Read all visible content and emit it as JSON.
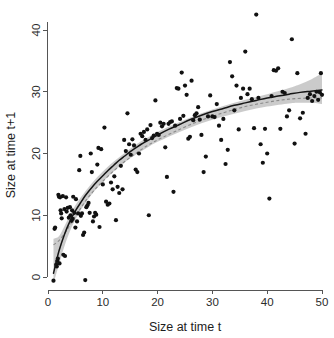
{
  "chart_data": {
    "type": "scatter",
    "title": "",
    "subtitle": "",
    "xlabel": "Size at time t",
    "ylabel": "Size at time t+1",
    "xlim": [
      -1,
      51
    ],
    "ylim": [
      -2.5,
      43.5
    ],
    "xticks": [
      0,
      10,
      20,
      30,
      40,
      50
    ],
    "yticks": [
      0,
      10,
      20,
      30,
      40
    ],
    "xtick_labels": [
      "0",
      "10",
      "20",
      "30",
      "40",
      "50"
    ],
    "ytick_labels": [
      "0",
      "10",
      "20",
      "30",
      "40"
    ],
    "grid": false,
    "legend": null,
    "legend_position": "none",
    "axis_style": "open-L",
    "background_color": "#ffffff",
    "point_color": "#111111",
    "point_radius": 2.1,
    "fit_line_color": "#151515",
    "ci_band_color": "#bdbdbd",
    "dashed_line_color": "#8a8a8a",
    "annotations": [],
    "series": [
      {
        "name": "observations",
        "type": "scatter",
        "x": [
          1.0,
          1.2,
          1.3,
          1.5,
          1.6,
          1.7,
          1.8,
          1.9,
          2.0,
          2.1,
          2.2,
          2.3,
          2.4,
          2.5,
          2.7,
          2.8,
          3.0,
          3.1,
          3.3,
          3.4,
          3.6,
          3.8,
          4.0,
          4.1,
          4.3,
          4.4,
          4.5,
          4.6,
          4.8,
          5.0,
          5.1,
          5.3,
          5.5,
          5.7,
          5.9,
          6.0,
          6.2,
          6.4,
          6.6,
          6.8,
          7.0,
          7.2,
          7.4,
          7.6,
          7.8,
          8.0,
          8.2,
          8.4,
          8.6,
          8.8,
          9.0,
          9.2,
          9.4,
          9.7,
          10.0,
          10.3,
          10.6,
          10.9,
          11.2,
          11.5,
          11.8,
          12.1,
          12.4,
          12.7,
          13.0,
          13.3,
          13.6,
          13.9,
          14.2,
          14.5,
          14.8,
          15.1,
          15.4,
          15.7,
          16.0,
          16.3,
          16.6,
          16.9,
          17.2,
          17.5,
          17.8,
          18.1,
          18.4,
          18.7,
          19.0,
          19.3,
          19.6,
          19.9,
          20.2,
          20.5,
          20.8,
          21.1,
          21.4,
          21.7,
          22.0,
          22.3,
          22.6,
          22.9,
          23.2,
          23.5,
          23.8,
          24.1,
          24.4,
          24.7,
          25.0,
          25.3,
          25.6,
          25.9,
          26.2,
          26.5,
          26.8,
          27.1,
          27.4,
          27.7,
          28.0,
          28.4,
          28.8,
          29.2,
          29.6,
          30.0,
          30.4,
          30.8,
          31.2,
          31.6,
          32.0,
          32.4,
          32.8,
          33.2,
          33.6,
          34.0,
          34.4,
          34.8,
          35.2,
          35.6,
          36.0,
          36.4,
          36.8,
          37.2,
          37.6,
          38.0,
          38.4,
          38.8,
          39.2,
          39.6,
          40.0,
          40.4,
          40.8,
          41.2,
          41.6,
          42.0,
          42.4,
          42.8,
          43.2,
          43.6,
          44.0,
          44.5,
          45.0,
          45.5,
          46.0,
          46.5,
          47.0,
          47.4,
          47.8,
          48.2,
          48.6,
          49.0,
          49.3,
          49.6,
          49.8,
          50.0
        ],
        "y": [
          -0.6,
          7.8,
          8.0,
          2.0,
          1.7,
          2.6,
          3.0,
          13.3,
          13.0,
          2.2,
          12.9,
          10.8,
          10.3,
          9.5,
          13.1,
          3.6,
          11.0,
          3.4,
          12.9,
          10.6,
          11.2,
          9.6,
          11.3,
          10.0,
          9.1,
          10.8,
          9.4,
          13.0,
          10.4,
          8.0,
          12.6,
          9.0,
          10.3,
          17.3,
          19.6,
          9.9,
          10.3,
          6.8,
          7.2,
          -0.5,
          11.3,
          11.6,
          12.0,
          10.4,
          20.0,
          17.0,
          9.0,
          9.8,
          10.4,
          10.1,
          18.2,
          20.9,
          8.1,
          20.7,
          15.0,
          24.2,
          12.2,
          11.7,
          11.9,
          15.3,
          14.2,
          16.3,
          9.2,
          14.6,
          13.6,
          18.0,
          14.2,
          22.2,
          20.4,
          26.5,
          21.5,
          19.8,
          22.3,
          21.3,
          17.4,
          17.0,
          20.0,
          23.2,
          22.8,
          23.5,
          22.2,
          23.9,
          10.0,
          24.6,
          22.5,
          22.9,
          28.6,
          23.2,
          23.0,
          25.0,
          24.4,
          24.8,
          21.0,
          16.2,
          24.8,
          25.1,
          25.2,
          13.8,
          24.5,
          30.6,
          30.5,
          25.6,
          33.1,
          26.1,
          31.0,
          29.5,
          22.4,
          22.7,
          31.8,
          25.4,
          26.2,
          26.5,
          27.5,
          25.5,
          23.0,
          17.0,
          19.5,
          26.0,
          29.4,
          26.0,
          25.9,
          28.0,
          24.5,
          22.2,
          25.6,
          18.3,
          20.6,
          34.8,
          32.5,
          27.0,
          31.0,
          23.9,
          29.0,
          30.5,
          36.5,
          29.6,
          30.5,
          28.8,
          24.1,
          42.5,
          29.0,
          21.5,
          18.5,
          24.0,
          20.0,
          12.7,
          29.3,
          33.5,
          33.4,
          33.8,
          24.0,
          30.0,
          29.8,
          26.0,
          27.0,
          38.5,
          21.6,
          33.0,
          25.7,
          26.6,
          23.2,
          29.0,
          29.6,
          28.5,
          29.3,
          30.0,
          28.7,
          29.9,
          33.0,
          29.5
        ]
      },
      {
        "name": "fitted-curve",
        "type": "line",
        "style": "solid",
        "x": [
          1.0,
          2.0,
          3.0,
          4.0,
          5.0,
          6.0,
          7.0,
          8.0,
          9.0,
          10.0,
          11.0,
          12.0,
          13.0,
          14.0,
          15.0,
          16.0,
          17.0,
          18.0,
          19.0,
          20.0,
          22.0,
          24.0,
          26.0,
          28.0,
          30.0,
          32.0,
          34.0,
          36.0,
          38.0,
          40.0,
          42.0,
          44.0,
          46.0,
          48.0,
          50.0
        ],
        "y": [
          0.6,
          4.2,
          6.9,
          9.0,
          10.7,
          12.1,
          13.4,
          14.5,
          15.5,
          16.4,
          17.3,
          18.1,
          18.9,
          19.6,
          20.3,
          20.9,
          21.5,
          22.0,
          22.5,
          23.0,
          23.9,
          24.7,
          25.5,
          26.2,
          26.8,
          27.3,
          27.8,
          28.2,
          28.6,
          29.0,
          29.3,
          29.6,
          29.9,
          30.1,
          30.3
        ]
      },
      {
        "name": "alternate-fit",
        "type": "line",
        "style": "dashed",
        "x": [
          1.0,
          2.0,
          3.0,
          4.0,
          5.0,
          6.0,
          7.0,
          8.0,
          9.0,
          10.0,
          12.0,
          14.0,
          16.0,
          18.0,
          20.0,
          24.0,
          28.0,
          32.0,
          36.0,
          40.0,
          44.0,
          48.0,
          50.0
        ],
        "y": [
          5.2,
          5.9,
          7.0,
          8.4,
          9.8,
          11.2,
          12.5,
          13.6,
          14.6,
          15.5,
          17.2,
          18.7,
          20.0,
          21.2,
          22.2,
          23.9,
          25.4,
          26.6,
          27.6,
          28.3,
          28.8,
          29.0,
          29.0
        ]
      },
      {
        "name": "confidence-band-upper",
        "type": "line",
        "x": [
          1.0,
          2.0,
          3.0,
          4.0,
          5.0,
          6.0,
          8.0,
          10.0,
          12.0,
          14.0,
          16.0,
          18.0,
          20.0,
          24.0,
          28.0,
          32.0,
          36.0,
          40.0,
          44.0,
          46.0,
          48.0,
          50.0
        ],
        "y": [
          6.2,
          6.6,
          8.2,
          10.0,
          11.6,
          12.9,
          15.2,
          17.1,
          18.7,
          20.1,
          21.4,
          22.5,
          23.5,
          25.1,
          26.5,
          27.7,
          28.7,
          29.6,
          30.6,
          31.2,
          32.0,
          33.0
        ]
      },
      {
        "name": "confidence-band-lower",
        "type": "line",
        "x": [
          1.0,
          2.0,
          3.0,
          4.0,
          5.0,
          6.0,
          8.0,
          10.0,
          12.0,
          14.0,
          16.0,
          18.0,
          20.0,
          24.0,
          28.0,
          32.0,
          36.0,
          40.0,
          44.0,
          46.0,
          48.0,
          50.0
        ],
        "y": [
          -1.0,
          2.0,
          5.0,
          7.4,
          9.3,
          10.9,
          13.4,
          15.4,
          17.1,
          18.6,
          19.8,
          20.9,
          21.9,
          23.5,
          24.9,
          26.0,
          26.9,
          27.6,
          28.1,
          28.2,
          28.2,
          28.0
        ]
      }
    ]
  }
}
